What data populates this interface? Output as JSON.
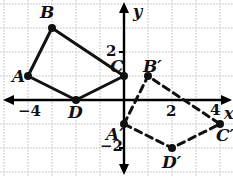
{
  "figure": {
    "colors": {
      "grid": "#b9b9c6",
      "axis": "#000000",
      "shape": "#111111",
      "image_shape": "#111111",
      "background": "#ffffff"
    },
    "grid": {
      "unit_px": 24,
      "origin_px": {
        "x": 124,
        "y": 100
      },
      "visible": true,
      "style": "dotted"
    },
    "axes": {
      "x_label": "x",
      "y_label": "y",
      "x_label_pos": {
        "x": 224,
        "y": 106
      },
      "y_label_pos": {
        "x": 133,
        "y": 4
      },
      "ticks": [
        {
          "text": "−4",
          "x": 18,
          "y": 104,
          "value": -4,
          "axis": "x"
        },
        {
          "text": "2",
          "x": 166,
          "y": 104,
          "value": 2,
          "axis": "x"
        },
        {
          "text": "4",
          "x": 210,
          "y": 103,
          "value": 4,
          "axis": "x"
        },
        {
          "text": "2",
          "x": 106,
          "y": 44,
          "value": 2,
          "axis": "y"
        },
        {
          "text": "−2",
          "x": 100,
          "y": 139,
          "value": -2,
          "axis": "y"
        }
      ]
    },
    "shapes": [
      {
        "name": "quadrilateral-abcd",
        "style": "solid",
        "vertices": [
          {
            "label": "A",
            "x": -4,
            "y": 1,
            "px": 28,
            "py": 76,
            "label_px": 12,
            "label_py": 68
          },
          {
            "label": "B",
            "x": -3,
            "y": 3,
            "px": 52,
            "py": 28,
            "label_px": 40,
            "label_py": 4
          },
          {
            "label": "C",
            "x": 0,
            "y": 1,
            "px": 124,
            "py": 76,
            "label_px": 110,
            "label_py": 58
          },
          {
            "label": "D",
            "x": -2,
            "y": 0,
            "px": 76,
            "py": 100,
            "label_px": 68,
            "label_py": 104
          }
        ]
      },
      {
        "name": "quadrilateral-a-prime-b-prime-c-prime-d-prime",
        "style": "dashed",
        "vertices": [
          {
            "label": "A′",
            "x": 0,
            "y": -1,
            "px": 124,
            "py": 124,
            "label_px": 106,
            "label_py": 126
          },
          {
            "label": "B′",
            "x": 1,
            "y": 1,
            "px": 148,
            "py": 76,
            "label_px": 143,
            "label_py": 58
          },
          {
            "label": "C′",
            "x": 4,
            "y": -1,
            "px": 220,
            "py": 124,
            "label_px": 216,
            "label_py": 127
          },
          {
            "label": "D′",
            "x": 2,
            "y": -2,
            "px": 172,
            "py": 148,
            "label_px": 162,
            "label_py": 154
          }
        ]
      }
    ]
  }
}
